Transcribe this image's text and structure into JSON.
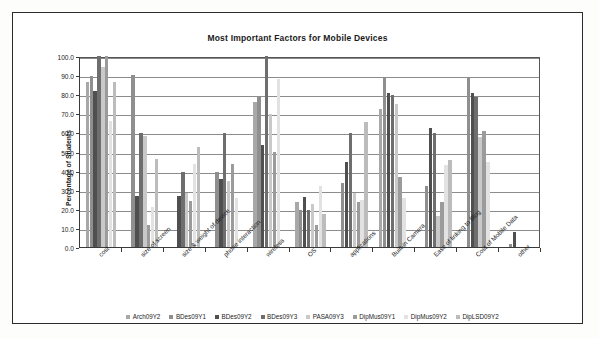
{
  "chart": {
    "title": "Most Important Factors for Mobile Devices",
    "y_axis_title": "Percentage of Students"
  },
  "chart_data": {
    "type": "bar",
    "title": "Most Important Factors for Mobile Devices",
    "xlabel": "",
    "ylabel": "Percentage of Students",
    "ylim": [
      0,
      100
    ],
    "ytick_labels": [
      "0.0",
      "10.0",
      "20.0",
      "30.0",
      "40.0",
      "50.0",
      "60.0",
      "70.0",
      "80.0",
      "90.0",
      "100.0"
    ],
    "ytick_values": [
      0,
      10,
      20,
      30,
      40,
      50,
      60,
      70,
      80,
      90,
      100
    ],
    "grid": true,
    "legend_position": "bottom",
    "categories": [
      "cost",
      "size of screen",
      "size & weight of device",
      "phone interaction",
      "wireless",
      "OS",
      "applications",
      "Built-in Camera",
      "Ease of linking to Blog",
      "Cost of Mobile Data",
      "other"
    ],
    "series": [
      {
        "name": "Arch09Y2",
        "color": "#a8a8a8",
        "values": [
          86.5,
          0.0,
          0.0,
          0.0,
          76.0,
          23.5,
          0.0,
          72.0,
          0.0,
          0.0,
          0.0
        ]
      },
      {
        "name": "BDes09Y1",
        "color": "#8f8f8f",
        "values": [
          89.5,
          90.0,
          0.0,
          39.5,
          79.0,
          19.5,
          33.5,
          88.5,
          32.0,
          88.5,
          1.5
        ]
      },
      {
        "name": "BDes09Y2",
        "color": "#4f4f4f",
        "values": [
          81.5,
          26.5,
          26.5,
          35.5,
          53.5,
          26.0,
          44.5,
          80.5,
          62.5,
          80.5,
          7.8
        ]
      },
      {
        "name": "BDes09Y3",
        "color": "#6e6e6e",
        "values": [
          100.0,
          59.5,
          39.5,
          59.5,
          100.0,
          19.5,
          59.5,
          79.5,
          59.5,
          78.5,
          0.0
        ]
      },
      {
        "name": "PASA09Y3",
        "color": "#c9c9c9",
        "values": [
          94.0,
          58.0,
          28.5,
          34.5,
          69.5,
          22.5,
          28.5,
          75.0,
          16.5,
          57.5,
          0.0
        ]
      },
      {
        "name": "DipMus09Y1",
        "color": "#9b9b9b",
        "values": [
          100.0,
          11.5,
          24.0,
          43.5,
          49.5,
          11.5,
          23.5,
          36.5,
          23.5,
          60.5,
          0.0
        ]
      },
      {
        "name": "DipMus09Y2",
        "color": "#e2e2e2",
        "values": [
          66.0,
          21.0,
          43.5,
          25.5,
          88.0,
          32.0,
          24.5,
          25.5,
          43.0,
          44.5,
          0.0
        ]
      },
      {
        "name": "DipLSD09Y2",
        "color": "#bcbcbc",
        "values": [
          86.5,
          46.0,
          52.5,
          0.0,
          0.0,
          17.5,
          65.5,
          0.0,
          45.5,
          0.0,
          0.0
        ]
      }
    ]
  }
}
